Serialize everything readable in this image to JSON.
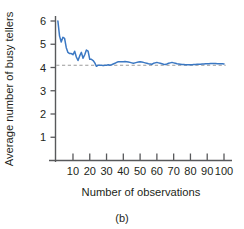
{
  "figure": {
    "caption": "(b)",
    "background": "#ffffff"
  },
  "chart_data": {
    "type": "line",
    "title": "",
    "xlabel": "Number of observations",
    "ylabel": "Average number of busy tellers",
    "xlim": [
      0,
      102
    ],
    "ylim": [
      0,
      6.4
    ],
    "xticks": [
      10,
      20,
      30,
      40,
      50,
      60,
      70,
      80,
      90,
      100
    ],
    "yticks": [
      1,
      2,
      3,
      4,
      5,
      6
    ],
    "grid": false,
    "legend": false,
    "series": [
      {
        "name": "Cumulative average busy tellers",
        "color": "#3b78c3",
        "linewidth": 1.5,
        "x": [
          1,
          2,
          3,
          4,
          5,
          6,
          7,
          8,
          9,
          10,
          11,
          12,
          13,
          14,
          15,
          16,
          17,
          18,
          19,
          20,
          21,
          22,
          23,
          24,
          25,
          26,
          27,
          28,
          29,
          30,
          31,
          32,
          33,
          34,
          35,
          36,
          37,
          38,
          39,
          40,
          41,
          42,
          43,
          44,
          45,
          46,
          47,
          48,
          49,
          50,
          51,
          52,
          53,
          54,
          55,
          56,
          57,
          58,
          59,
          60,
          61,
          62,
          63,
          64,
          65,
          66,
          67,
          68,
          69,
          70,
          71,
          72,
          73,
          74,
          75,
          76,
          77,
          78,
          79,
          80,
          81,
          82,
          83,
          84,
          85,
          86,
          87,
          88,
          89,
          90,
          91,
          92,
          93,
          94,
          95,
          96,
          97,
          98,
          99,
          100
        ],
        "y": [
          6.0,
          5.35,
          5.1,
          5.3,
          5.25,
          4.85,
          4.65,
          4.6,
          4.6,
          4.55,
          4.7,
          4.45,
          4.3,
          4.5,
          4.65,
          4.4,
          4.55,
          4.75,
          4.7,
          4.35,
          4.35,
          4.3,
          4.2,
          4.05,
          4.1,
          4.1,
          4.1,
          4.08,
          4.1,
          4.1,
          4.12,
          4.1,
          4.12,
          4.15,
          4.18,
          4.22,
          4.25,
          4.25,
          4.25,
          4.25,
          4.26,
          4.25,
          4.24,
          4.22,
          4.2,
          4.18,
          4.2,
          4.22,
          4.24,
          4.25,
          4.24,
          4.22,
          4.2,
          4.18,
          4.16,
          4.15,
          4.14,
          4.18,
          4.2,
          4.22,
          4.2,
          4.18,
          4.16,
          4.14,
          4.13,
          4.15,
          4.18,
          4.2,
          4.22,
          4.2,
          4.18,
          4.16,
          4.15,
          4.14,
          4.13,
          4.13,
          4.12,
          4.12,
          4.12,
          4.12,
          4.12,
          4.13,
          4.13,
          4.14,
          4.14,
          4.14,
          4.15,
          4.15,
          4.16,
          4.16,
          4.16,
          4.17,
          4.17,
          4.17,
          4.17,
          4.16,
          4.16,
          4.16,
          4.16,
          4.15
        ]
      }
    ],
    "reference_line": {
      "name": "steady-state average",
      "orientation": "horizontal",
      "value": 4.1,
      "style": "dashed",
      "color": "#9a9a9a"
    },
    "colors": {
      "line": "#3b78c3",
      "reference": "#9a9a9a",
      "axis": "#58595b",
      "text": "#231f20"
    }
  }
}
